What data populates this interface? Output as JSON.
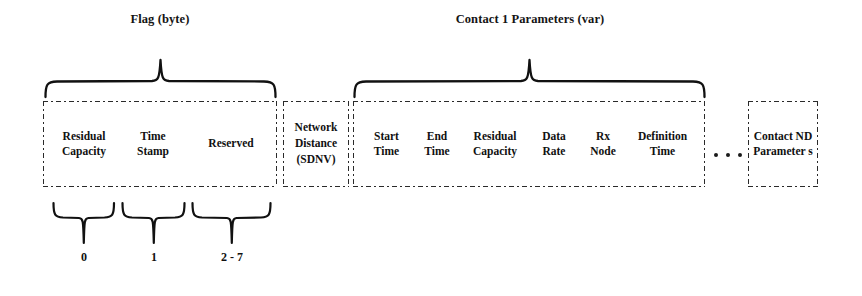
{
  "diagram": {
    "background_color": "#ffffff",
    "line_color": "#111111",
    "groups": {
      "flag": {
        "caption": "Flag (byte)",
        "fields": [
          {
            "label": "Residual Capacity",
            "line1": "Residual",
            "line2": "Capacity"
          },
          {
            "label": "Time Stamp",
            "line1": "Time",
            "line2": "Stamp"
          },
          {
            "label": "Reserved",
            "line1": "Reserved",
            "line2": ""
          }
        ]
      },
      "network_distance": {
        "label": "Network Distance (SDNV)",
        "line1": "Network",
        "line2": "Distance",
        "line3": "(SDNV)"
      },
      "contact1": {
        "caption": "Contact 1 Parameters (var)",
        "fields": [
          {
            "label": "Start Time",
            "line1": "Start",
            "line2": "Time"
          },
          {
            "label": "End Time",
            "line1": "End",
            "line2": "Time"
          },
          {
            "label": "Residual Capacity",
            "line1": "Residual",
            "line2": "Capacity"
          },
          {
            "label": "Data Rate",
            "line1": "Data",
            "line2": "Rate"
          },
          {
            "label": "Rx Node",
            "line1": "Rx",
            "line2": "Node"
          },
          {
            "label": "Definition Time",
            "line1": "Definition",
            "line2": "Time"
          }
        ]
      },
      "contact_nd": {
        "label": "Contact ND Parameters",
        "line1": "Contact",
        "line2": "ND",
        "line3": "Parameter",
        "line4": "s"
      }
    },
    "bit_labels": [
      {
        "text": "0"
      },
      {
        "text": "1"
      },
      {
        "text": "2 - 7"
      }
    ]
  }
}
